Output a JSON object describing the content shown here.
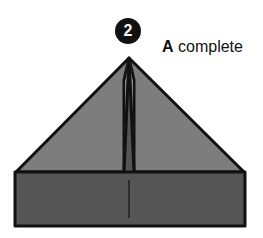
{
  "step": {
    "number": "2"
  },
  "caption": {
    "letter": "A",
    "text": " complete"
  },
  "colors": {
    "triangle": "#7d7d7d",
    "base": "#555555",
    "outline": "#111111"
  }
}
